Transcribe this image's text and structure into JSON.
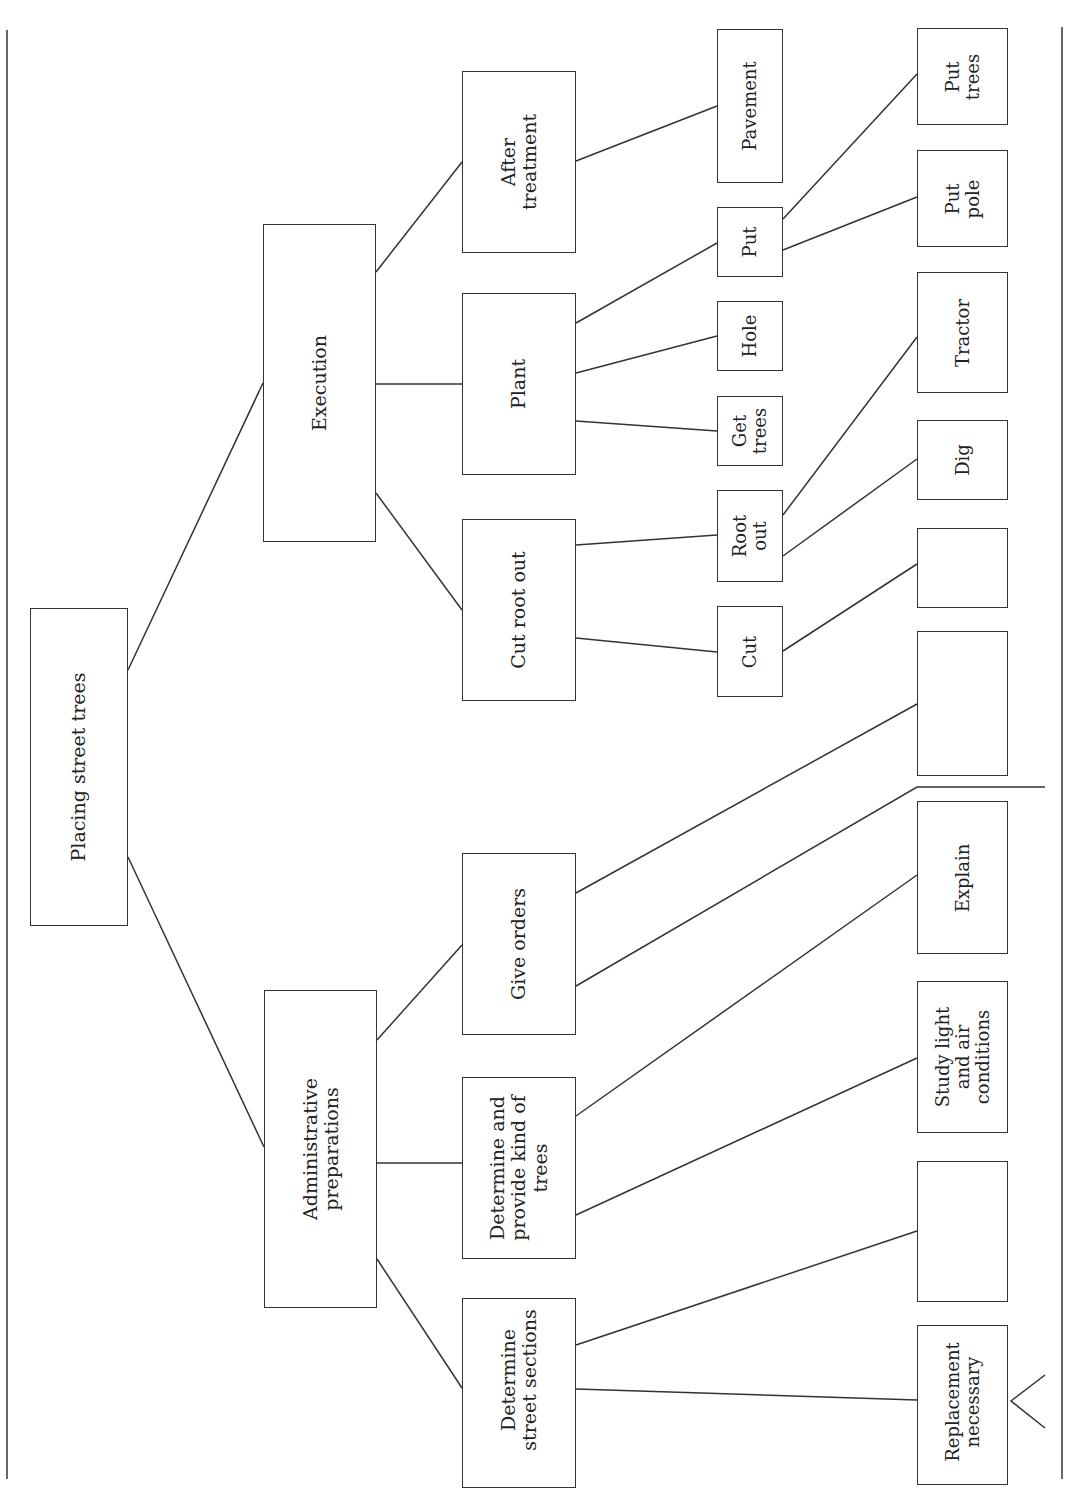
{
  "diagram": {
    "type": "tree",
    "orientation": "rotated-90-ccw",
    "root": {
      "id": "root",
      "label": "Placing street trees"
    },
    "nodes": {
      "root": "Placing street trees",
      "execution": "Execution",
      "admin": "Administrative\npreparations",
      "after_treatment": "After\ntreatment",
      "plant": "Plant",
      "cut_root_out": "Cut root out",
      "give_orders": "Give orders",
      "determine_kind": "Determine and\nprovide kind of\ntrees",
      "determine_sections": "Determine\nstreet sections",
      "pavement": "Pavement",
      "put": "Put",
      "hole": "Hole",
      "get_trees": "Get\ntrees",
      "root_out": "Root\nout",
      "cut": "Cut",
      "put_trees": "Put\ntrees",
      "put_pole": "Put\npole",
      "tractor": "Tractor",
      "dig": "Dig",
      "blank_1": "",
      "blank_2": "",
      "explain": "Explain",
      "study_light": "Study light\nand air\nconditions",
      "blank_3": "",
      "replacement": "Replacement\nnecessary"
    },
    "edges": [
      [
        "root",
        "execution"
      ],
      [
        "root",
        "admin"
      ],
      [
        "execution",
        "after_treatment"
      ],
      [
        "execution",
        "plant"
      ],
      [
        "execution",
        "cut_root_out"
      ],
      [
        "admin",
        "give_orders"
      ],
      [
        "admin",
        "determine_kind"
      ],
      [
        "admin",
        "determine_sections"
      ],
      [
        "after_treatment",
        "pavement"
      ],
      [
        "plant",
        "put"
      ],
      [
        "plant",
        "hole"
      ],
      [
        "plant",
        "get_trees"
      ],
      [
        "cut_root_out",
        "root_out"
      ],
      [
        "cut_root_out",
        "cut"
      ],
      [
        "put",
        "put_trees"
      ],
      [
        "put",
        "put_pole"
      ],
      [
        "root_out",
        "tractor"
      ],
      [
        "root_out",
        "dig"
      ],
      [
        "cut",
        "blank_1"
      ],
      [
        "give_orders",
        "blank_2"
      ],
      [
        "give_orders",
        "separator_line"
      ],
      [
        "determine_kind",
        "explain"
      ],
      [
        "determine_kind",
        "study_light"
      ],
      [
        "determine_sections",
        "blank_3"
      ],
      [
        "determine_sections",
        "replacement"
      ]
    ]
  }
}
